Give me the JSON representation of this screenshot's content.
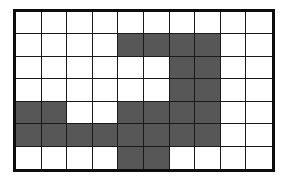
{
  "figure": {
    "type": "grid-raster",
    "title": "",
    "background_color": "#ffffff"
  },
  "grid": {
    "columns": 10,
    "rows": 7,
    "border_color": "#0d0d0d",
    "border_width_px": 3,
    "gridline_color": "#1a1a1a",
    "gridline_width_px": 1.6,
    "empty_cell_color": "#ffffff",
    "filled_cell_color": "#575757",
    "filled_count": 28,
    "empty_count": 42,
    "bounds_px": {
      "left": 13,
      "top": 9,
      "width": 262,
      "height": 163
    },
    "row_labels": [
      "1",
      "2",
      "3",
      "4",
      "5",
      "6",
      "7"
    ],
    "column_labels": [
      "1",
      "2",
      "3",
      "4",
      "5",
      "6",
      "7",
      "8",
      "9",
      "10"
    ],
    "cells": [
      [
        0,
        0,
        0,
        0,
        0,
        0,
        0,
        0,
        0,
        0
      ],
      [
        0,
        0,
        0,
        0,
        1,
        1,
        1,
        1,
        0,
        0
      ],
      [
        0,
        0,
        0,
        0,
        0,
        0,
        1,
        1,
        0,
        0
      ],
      [
        0,
        0,
        0,
        0,
        0,
        0,
        1,
        1,
        0,
        0
      ],
      [
        1,
        1,
        0,
        0,
        1,
        1,
        1,
        1,
        0,
        0
      ],
      [
        1,
        1,
        1,
        1,
        1,
        1,
        1,
        1,
        0,
        0
      ],
      [
        0,
        0,
        0,
        0,
        1,
        1,
        0,
        0,
        0,
        0
      ]
    ],
    "filled_cells_by_row": [
      {
        "row": 1,
        "columns": []
      },
      {
        "row": 2,
        "columns": [
          5,
          6,
          7,
          8
        ]
      },
      {
        "row": 3,
        "columns": [
          7,
          8
        ]
      },
      {
        "row": 4,
        "columns": [
          7,
          8
        ]
      },
      {
        "row": 5,
        "columns": [
          1,
          2,
          5,
          6,
          7,
          8
        ]
      },
      {
        "row": 6,
        "columns": [
          1,
          2,
          3,
          4,
          5,
          6,
          7,
          8
        ]
      },
      {
        "row": 7,
        "columns": [
          5,
          6
        ]
      }
    ]
  }
}
